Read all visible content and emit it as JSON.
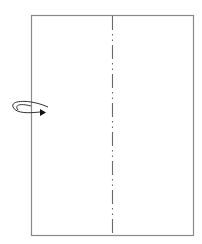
{
  "diagram": {
    "type": "origami-fold-instruction",
    "paper": {
      "x": 31,
      "y": 15,
      "width": 162,
      "height": 220,
      "stroke": "#8a8a8a",
      "fill": "#ffffff"
    },
    "fold_line": {
      "style": "mountain-fold (dash-dot-dot)",
      "x": 112,
      "y1": 15,
      "y2": 235,
      "stroke": "#6a6a6a"
    },
    "arrow": {
      "meaning": "turn-over",
      "color": "#222222"
    }
  }
}
